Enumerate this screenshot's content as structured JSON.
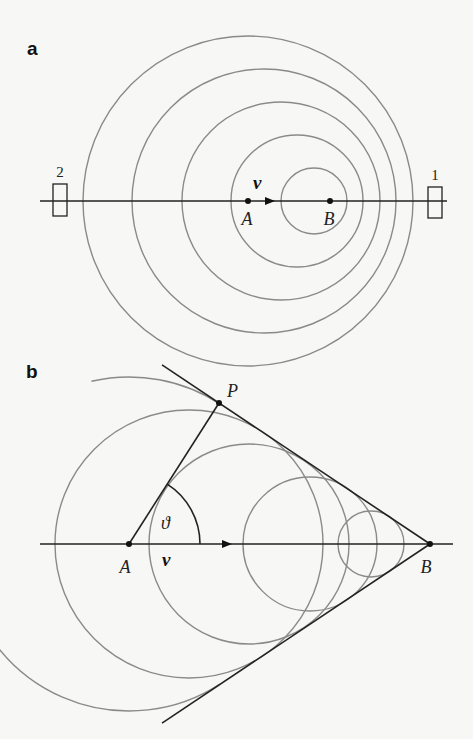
{
  "panel_a": {
    "label": "a",
    "axis": {
      "x1": 40,
      "x2": 447,
      "y": 201
    },
    "circles": [
      {
        "cx": 248,
        "r": 165
      },
      {
        "cx": 264,
        "r": 132
      },
      {
        "cx": 281,
        "r": 99
      },
      {
        "cx": 297,
        "r": 66
      },
      {
        "cx": 314,
        "r": 33
      }
    ],
    "points": [
      {
        "name": "A",
        "x": 248,
        "label": "A"
      },
      {
        "name": "B",
        "x": 330,
        "label": "B"
      }
    ],
    "velocity_label": "v",
    "detectors": [
      {
        "id": "2",
        "label": "2",
        "x": 53,
        "y": 184,
        "w": 14,
        "h": 32
      },
      {
        "id": "1",
        "label": "1",
        "x": 428,
        "y": 187,
        "w": 14,
        "h": 31
      }
    ]
  },
  "panel_b": {
    "label": "b",
    "axis": {
      "x1": 40,
      "x2": 453,
      "y": 544
    },
    "circles": [
      {
        "cx": 189,
        "r": 134
      },
      {
        "cx": 249,
        "r": 100
      },
      {
        "cx": 310,
        "r": 67
      },
      {
        "cx": 371,
        "r": 33
      }
    ],
    "big_arc": {
      "cx": 129,
      "r": 167
    },
    "points": [
      {
        "name": "A",
        "x": 129,
        "label": "A"
      },
      {
        "name": "B",
        "x": 430,
        "label": "B"
      }
    ],
    "point_P": {
      "x": 219,
      "y": 403,
      "label": "P"
    },
    "angle_label": "ϑ",
    "velocity_label": "v"
  }
}
